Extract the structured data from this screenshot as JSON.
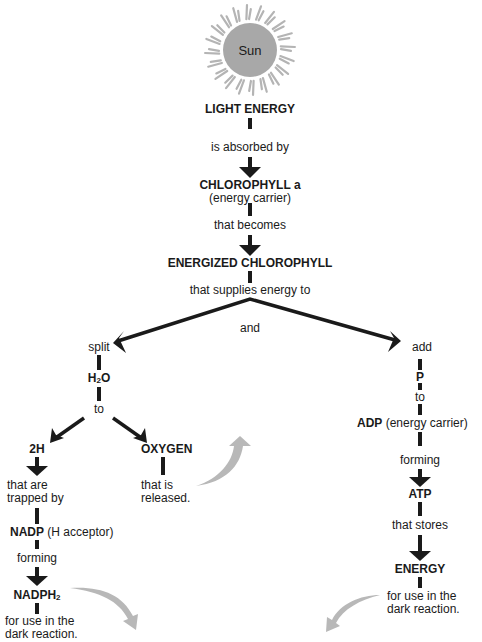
{
  "sun": {
    "label": "Sun",
    "fill": "#a8a8a8",
    "ray_color": "#b4b4b4"
  },
  "colors": {
    "ink": "#1a1a1a",
    "grey_arrow": "#b8b8b8"
  },
  "center_chain": {
    "light_energy": "LIGHT ENERGY",
    "absorbed_by": "is absorbed by",
    "chlorophyll_a": "CHLOROPHYLL a",
    "energy_carrier": "(energy carrier)",
    "that_becomes": "that becomes",
    "energized_chlorophyll": "ENERGIZED CHLOROPHYLL",
    "supplies_energy": "that supplies energy to",
    "and": "and"
  },
  "left_branch": {
    "split": "split",
    "h2o_main": "H",
    "h2o_sub": "2",
    "h2o_tail": "O",
    "to": "to",
    "two_h": "2H",
    "trapped_line1": "that are",
    "trapped_line2": "trapped by",
    "nadp": "NADP",
    "h_acceptor": "(H acceptor)",
    "forming": "forming",
    "nadph_main": "NADPH",
    "nadph_sub": "2",
    "use_line1": "for use in the",
    "use_line2": "dark reaction.",
    "oxygen": "OXYGEN",
    "released_line1": "that is",
    "released_line2": "released."
  },
  "right_branch": {
    "add": "add",
    "p": "P",
    "to": "to",
    "adp": "ADP",
    "adp_note": "(energy carrier)",
    "forming": "forming",
    "atp": "ATP",
    "that_stores": "that stores",
    "energy": "ENERGY",
    "use_line1": "for use in the",
    "use_line2": "dark reaction."
  }
}
